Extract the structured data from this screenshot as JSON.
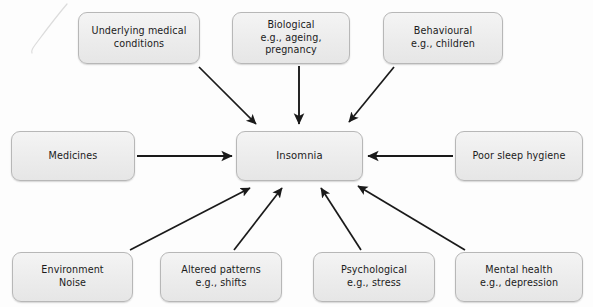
{
  "diagram": {
    "type": "concept-map",
    "center": {
      "id": "insomnia",
      "label": "Insomnia"
    },
    "colors": {
      "box_fill": "#ececec",
      "box_border": "#b7b7b7",
      "text": "#1b1b1b",
      "arrow": "#1a1a1a",
      "background": "#fdfdfd"
    },
    "nodes": [
      {
        "id": "underlying",
        "label": "Underlying medical\nconditions",
        "row": "top",
        "position": 1
      },
      {
        "id": "biological",
        "label": "Biological\ne.g., ageing, pregnancy",
        "row": "top",
        "position": 2
      },
      {
        "id": "behavioural",
        "label": "Behavioural\ne.g., children",
        "row": "top",
        "position": 3
      },
      {
        "id": "medicines",
        "label": "Medicines",
        "row": "middle",
        "position": 1
      },
      {
        "id": "hygiene",
        "label": "Poor sleep hygiene",
        "row": "middle",
        "position": 3
      },
      {
        "id": "environment",
        "label": "Environment\nNoise",
        "row": "bottom",
        "position": 1
      },
      {
        "id": "altered",
        "label": "Altered patterns\ne.g., shifts",
        "row": "bottom",
        "position": 2
      },
      {
        "id": "psychological",
        "label": "Psychological\ne.g., stress",
        "row": "bottom",
        "position": 3
      },
      {
        "id": "mental",
        "label": "Mental health\ne.g., depression",
        "row": "bottom",
        "position": 4
      }
    ],
    "edges": [
      {
        "from": "underlying",
        "to": "insomnia",
        "direction": "to-center"
      },
      {
        "from": "biological",
        "to": "insomnia",
        "direction": "to-center"
      },
      {
        "from": "behavioural",
        "to": "insomnia",
        "direction": "to-center"
      },
      {
        "from": "medicines",
        "to": "insomnia",
        "direction": "to-center"
      },
      {
        "from": "hygiene",
        "to": "insomnia",
        "direction": "to-center"
      },
      {
        "from": "environment",
        "to": "insomnia",
        "direction": "to-center"
      },
      {
        "from": "altered",
        "to": "insomnia",
        "direction": "to-center"
      },
      {
        "from": "psychological",
        "to": "insomnia",
        "direction": "to-center"
      },
      {
        "from": "mental",
        "to": "insomnia",
        "direction": "to-center"
      }
    ]
  }
}
